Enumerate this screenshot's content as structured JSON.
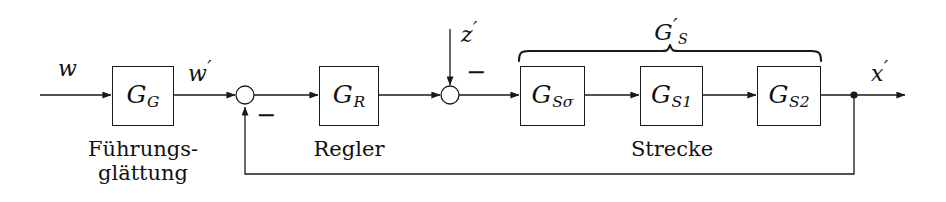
{
  "diagram": {
    "type": "control-block-diagram",
    "canvas": {
      "width": 946,
      "height": 202,
      "background": "#ffffff"
    },
    "line_color": "#1a1a1a",
    "text_color": "#111111"
  },
  "blocks": [
    {
      "id": "GG",
      "base": "G",
      "subscript": "G",
      "prime": "",
      "x": 112,
      "y": 66,
      "w": 62,
      "h": 60
    },
    {
      "id": "GR",
      "base": "G",
      "subscript": "R",
      "prime": "",
      "x": 319,
      "y": 66,
      "w": 60,
      "h": 60
    },
    {
      "id": "GSsigma",
      "base": "G",
      "subscript": "Sσ",
      "prime": "",
      "x": 520,
      "y": 66,
      "w": 65,
      "h": 60
    },
    {
      "id": "GS1",
      "base": "G",
      "subscript": "S1",
      "prime": "",
      "x": 640,
      "y": 66,
      "w": 63,
      "h": 60
    },
    {
      "id": "GS2",
      "base": "G",
      "subscript": "S2",
      "prime": "",
      "x": 757,
      "y": 66,
      "w": 64,
      "h": 60
    }
  ],
  "block_labels": {
    "GG": "G",
    "GG_sub": "G",
    "GR": "G",
    "GR_sub": "R",
    "GSsigma": "G",
    "GSsigma_sub": "Sσ",
    "GS1": "G",
    "GS1_sub": "S1",
    "GS2": "G",
    "GS2_sub": "S2"
  },
  "signals": {
    "input_w": "w",
    "after_gg_w_prime_base": "w",
    "after_gg_w_prime_mark": "′",
    "disturbance_z_base": "z",
    "disturbance_z_mark": "′",
    "output_x_base": "x",
    "output_x_mark": "′"
  },
  "captions": {
    "fuehrungsglaettung_line1": "Führungs-",
    "fuehrungsglaettung_line2": "glättung",
    "regler": "Regler",
    "strecke": "Strecke"
  },
  "brace": {
    "label_base": "G",
    "label_prime": "′",
    "label_sub": "S",
    "span_x_start": 519,
    "span_x_end": 821,
    "y": 57
  },
  "summing_junctions": [
    {
      "id": "sum1",
      "cx": 245,
      "cy": 95,
      "r": 9,
      "sign": "−",
      "sign_x": 256,
      "sign_y": 105
    },
    {
      "id": "sum2",
      "cx": 450,
      "cy": 95,
      "r": 9,
      "sign": "−",
      "sign_x": 466,
      "sign_y": 62
    }
  ],
  "nodes": [
    {
      "id": "feedback-tap",
      "cx": 854,
      "cy": 95,
      "r": 3.6
    }
  ],
  "feedback": {
    "from_x": 854,
    "to_x": 245,
    "y": 174
  }
}
